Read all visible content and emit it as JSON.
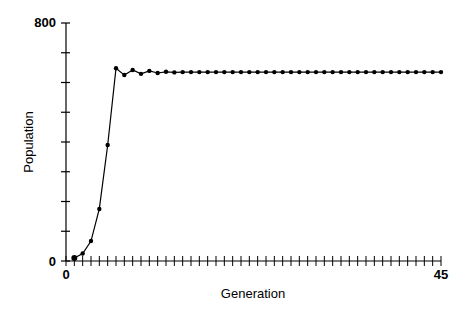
{
  "chart_data": {
    "type": "line",
    "title": "",
    "xlabel": "Generation",
    "ylabel": "Population",
    "xlim": [
      0,
      45
    ],
    "ylim": [
      0,
      800
    ],
    "x_tick_labels": [
      "0",
      "45"
    ],
    "y_tick_labels": [
      "0",
      "800"
    ],
    "x_minor_tick_step": 1,
    "y_minor_tick_step": 100,
    "grid": false,
    "legend": null,
    "series": [
      {
        "name": "Population",
        "marker": "dot",
        "x": [
          1,
          2,
          3,
          4,
          5,
          6,
          7,
          8,
          9,
          10,
          11,
          12,
          13,
          14,
          15,
          16,
          17,
          18,
          19,
          20,
          21,
          22,
          23,
          24,
          25,
          26,
          27,
          28,
          29,
          30,
          31,
          32,
          33,
          34,
          35,
          36,
          37,
          38,
          39,
          40,
          41,
          42,
          43,
          44,
          45
        ],
        "values": [
          10,
          25,
          67,
          175,
          390,
          648,
          625,
          642,
          629,
          639,
          632,
          636,
          634,
          635,
          635,
          635,
          635,
          635,
          635,
          635,
          635,
          635,
          635,
          635,
          635,
          635,
          635,
          635,
          635,
          635,
          635,
          635,
          635,
          635,
          635,
          635,
          635,
          635,
          635,
          635,
          635,
          635,
          635,
          635,
          635
        ]
      }
    ]
  }
}
